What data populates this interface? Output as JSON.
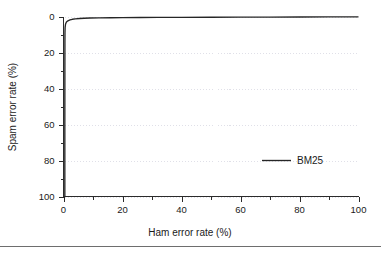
{
  "chart_data": {
    "type": "line",
    "title": "",
    "subtitle": "",
    "xlabel": "Ham error rate (%)",
    "ylabel": "Spam error rate (%)",
    "xlim": [
      0,
      100
    ],
    "ylim": [
      0,
      100
    ],
    "y_axis_inverted": true,
    "grid": "horizontal-dotted",
    "legend_position": "center-right",
    "x_ticks": [
      0,
      20,
      40,
      60,
      80,
      100
    ],
    "x_tick_labels": [
      "0",
      "20",
      "40",
      "60",
      "80",
      "100"
    ],
    "x_minor_ticks": [
      10,
      30,
      50,
      70,
      90
    ],
    "y_ticks": [
      0,
      20,
      40,
      60,
      80,
      100
    ],
    "y_tick_labels": [
      "0",
      "20",
      "40",
      "60",
      "80",
      "100"
    ],
    "y_minor_ticks": [
      10,
      30,
      50,
      70,
      90
    ],
    "series": [
      {
        "name": "BM25",
        "color": "#262626",
        "points": [
          [
            0.45,
            100.0
          ],
          [
            0.45,
            60.0
          ],
          [
            0.46,
            40.0
          ],
          [
            0.47,
            25.0
          ],
          [
            0.48,
            15.0
          ],
          [
            0.5,
            9.0
          ],
          [
            0.55,
            6.0
          ],
          [
            0.7,
            4.2
          ],
          [
            1.0,
            3.1
          ],
          [
            1.5,
            2.4
          ],
          [
            2.2,
            1.9
          ],
          [
            3.0,
            1.55
          ],
          [
            4.0,
            1.3
          ],
          [
            5.5,
            1.1
          ],
          [
            7.0,
            0.95
          ],
          [
            9.0,
            0.85
          ],
          [
            12.0,
            0.75
          ],
          [
            16.0,
            0.67
          ],
          [
            20.0,
            0.6
          ],
          [
            26.0,
            0.54
          ],
          [
            32.0,
            0.5
          ],
          [
            40.0,
            0.45
          ],
          [
            50.0,
            0.4
          ],
          [
            60.0,
            0.36
          ],
          [
            70.0,
            0.32
          ],
          [
            80.0,
            0.28
          ],
          [
            90.0,
            0.24
          ],
          [
            100.0,
            0.2
          ]
        ]
      }
    ]
  },
  "legend": {
    "entries": [
      {
        "label": "BM25"
      }
    ]
  },
  "axes": {
    "x_title": "Ham error rate (%)",
    "y_title": "Spam error rate (%)"
  }
}
